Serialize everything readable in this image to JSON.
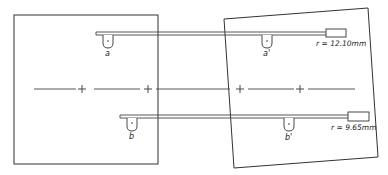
{
  "diagram": {
    "type": "two-frame schematic with rods and pivots",
    "colors": {
      "stroke": "#333333",
      "background": "#ffffff"
    },
    "left_frame": {
      "label": "reference frame (upright)"
    },
    "right_frame": {
      "label": "rotated frame"
    },
    "rods": [
      {
        "id": "upper",
        "radius_label": "r = 12.10mm",
        "points": [
          "a",
          "a'"
        ]
      },
      {
        "id": "lower",
        "radius_label": "r = 9.65mm",
        "points": [
          "b",
          "b'"
        ]
      }
    ],
    "points": {
      "a": "a",
      "a_prime": "a'",
      "b": "b",
      "b_prime": "b'"
    },
    "center_line": {
      "marks": [
        "+",
        "+",
        "+",
        "+"
      ]
    }
  }
}
